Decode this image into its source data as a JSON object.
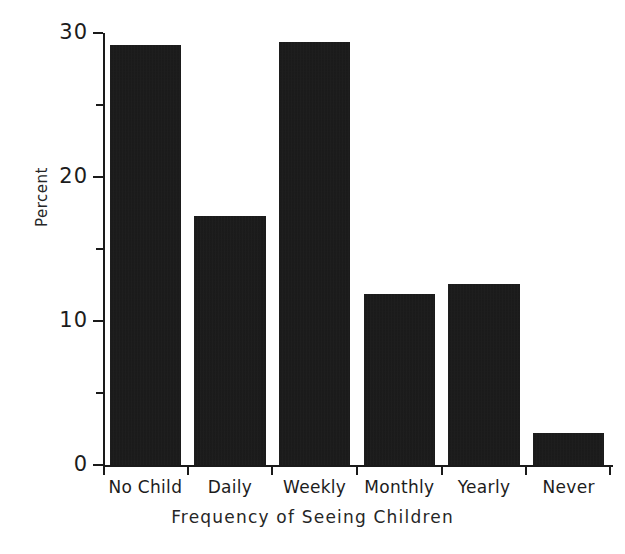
{
  "chart_data": {
    "type": "bar",
    "title": "",
    "xlabel": "Frequency of Seeing Children",
    "ylabel": "Percent",
    "categories": [
      "No Child",
      "Daily",
      "Weekly",
      "Monthly",
      "Yearly",
      "Never"
    ],
    "values": [
      29.2,
      17.3,
      29.4,
      11.9,
      12.6,
      2.2
    ],
    "ylim": [
      0,
      30
    ],
    "yticks_major": [
      0,
      10,
      20,
      30
    ],
    "yticks_major_labels": [
      "0",
      "10",
      "20",
      "30"
    ],
    "yticks_minor": [
      5,
      15,
      25
    ],
    "grid": false,
    "legend": false,
    "legend_position": "none",
    "bar_color": "#141414",
    "axis_color": "#1a1a1a",
    "background_color": "#ffffff"
  }
}
